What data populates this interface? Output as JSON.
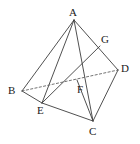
{
  "figure": {
    "type": "geometry-diagram",
    "background_color": "#ffffff",
    "stroke_color": "#3c3c3c",
    "dashed_stroke_color": "#5a5a5a",
    "label_color": "#1a1a1a",
    "canvas": {
      "width": 140,
      "height": 144
    },
    "vertices": [
      {
        "id": "A",
        "label": "A",
        "x": 74,
        "y": 20,
        "label_x": 69,
        "label_y": 7
      },
      {
        "id": "B",
        "label": "B",
        "x": 22,
        "y": 91,
        "label_x": 8,
        "label_y": 85
      },
      {
        "id": "C",
        "label": "C",
        "x": 93,
        "y": 121,
        "label_x": 89,
        "label_y": 126
      },
      {
        "id": "D",
        "label": "D",
        "x": 118,
        "y": 70,
        "label_x": 121,
        "label_y": 63
      },
      {
        "id": "E",
        "label": "E",
        "x": 42,
        "y": 103,
        "label_x": 37,
        "label_y": 105
      },
      {
        "id": "F",
        "label": "F",
        "x": 77,
        "y": 80,
        "label_x": 77,
        "label_y": 84
      },
      {
        "id": "G",
        "label": "G",
        "x": 100,
        "y": 46,
        "label_x": 101,
        "label_y": 34
      }
    ],
    "edges": [
      {
        "from": "A",
        "to": "B",
        "style": "solid"
      },
      {
        "from": "A",
        "to": "E",
        "style": "solid"
      },
      {
        "from": "A",
        "to": "C",
        "style": "solid"
      },
      {
        "from": "A",
        "to": "D",
        "style": "solid"
      },
      {
        "from": "B",
        "to": "E",
        "style": "solid"
      },
      {
        "from": "E",
        "to": "C",
        "style": "solid"
      },
      {
        "from": "C",
        "to": "D",
        "style": "solid"
      },
      {
        "from": "B",
        "to": "D",
        "style": "dashed"
      },
      {
        "from": "E",
        "to": "G",
        "style": "solid"
      },
      {
        "from": "F",
        "to": "C",
        "style": "solid"
      }
    ],
    "intersection_points": [
      {
        "id": "F",
        "on_edges": [
          "B-D",
          "E-G"
        ]
      },
      {
        "id": "G",
        "on_edges": [
          "A-D"
        ]
      }
    ]
  }
}
